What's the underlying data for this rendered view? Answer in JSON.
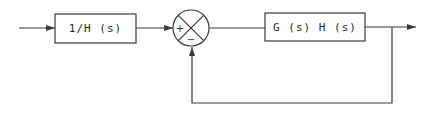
{
  "diagram": {
    "type": "block-diagram",
    "blocks": [
      {
        "id": "prefilter",
        "label": "1/H (s)"
      },
      {
        "id": "forward",
        "label": "G (s) H (s)"
      }
    ],
    "summing_junction": {
      "inputs": [
        {
          "from": "prefilter",
          "sign": "+"
        },
        {
          "from": "feedback",
          "sign": "−"
        }
      ]
    },
    "signals": [
      "input",
      "output"
    ],
    "feedback": "unity"
  },
  "colors": {
    "line": "#3a3a3a",
    "background": "#ffffff"
  }
}
